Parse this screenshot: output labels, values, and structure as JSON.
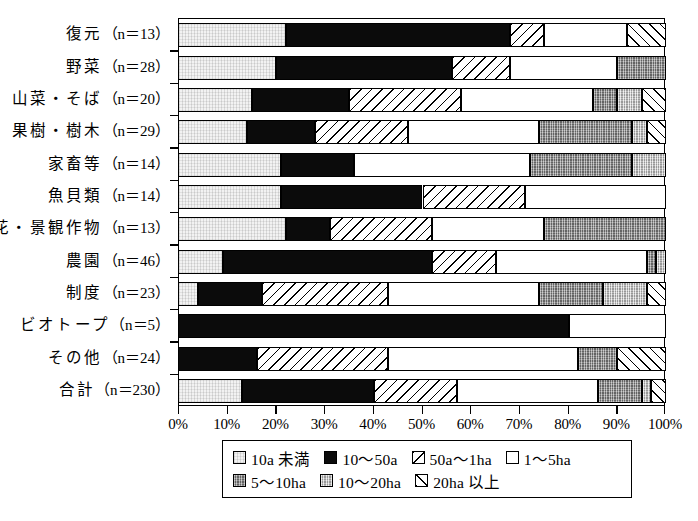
{
  "chart_data": {
    "type": "bar",
    "orientation": "horizontal",
    "stacked": true,
    "normalized": true,
    "title": "",
    "xlabel": "",
    "ylabel": "",
    "xlim": [
      0,
      100
    ],
    "xticks": [
      "0%",
      "10%",
      "20%",
      "30%",
      "40%",
      "50%",
      "60%",
      "70%",
      "80%",
      "90%",
      "100%"
    ],
    "grid": false,
    "legend_position": "bottom",
    "categories": [
      {
        "name": "復元",
        "n": "13",
        "label_name": "復元",
        "label_count": "（n＝13）"
      },
      {
        "name": "野菜",
        "n": "28",
        "label_name": "野菜",
        "label_count": "（n＝28）"
      },
      {
        "name": "山菜・そば",
        "n": "20",
        "label_name": "山菜・そば",
        "label_count": "（n＝20）"
      },
      {
        "name": "果樹・樹木",
        "n": "29",
        "label_name": "果樹・樹木",
        "label_count": "（n＝29）"
      },
      {
        "name": "家畜等",
        "n": "14",
        "label_name": "家畜等",
        "label_count": "（n＝14）"
      },
      {
        "name": "魚貝類",
        "n": "14",
        "label_name": "魚貝類",
        "label_count": "（n＝14）"
      },
      {
        "name": "花・景観作物",
        "n": "13",
        "label_name": "花・景観作物",
        "label_count": "（n＝13）"
      },
      {
        "name": "農園",
        "n": "46",
        "label_name": "農園",
        "label_count": "（n＝46）"
      },
      {
        "name": "制度",
        "n": "23",
        "label_name": "制度",
        "label_count": "（n＝23）"
      },
      {
        "name": "ビオトープ",
        "n": "5",
        "label_name": "ビオトープ",
        "label_count": "（n＝5）"
      },
      {
        "name": "その他",
        "n": "24",
        "label_name": "その他",
        "label_count": "（n＝24）"
      },
      {
        "name": "合計",
        "n": "230",
        "label_name": "合計",
        "label_count": "（n＝230）"
      }
    ],
    "series": [
      {
        "name": "10a未満",
        "key": "lt10a",
        "pattern": "fine-dotted-light-gray",
        "values": [
          22,
          20,
          15,
          14,
          21,
          21,
          22,
          9,
          4,
          0,
          0,
          13
        ]
      },
      {
        "name": "10～50a",
        "key": "a10_50",
        "pattern": "solid-black",
        "values": [
          46,
          36,
          20,
          14,
          15,
          29,
          9,
          43,
          13,
          80,
          16,
          27
        ]
      },
      {
        "name": "50a～1ha",
        "key": "a50_1ha",
        "pattern": "diagonal-hatch-down",
        "values": [
          7,
          12,
          23,
          19,
          0,
          21,
          21,
          13,
          26,
          0,
          27,
          17
        ]
      },
      {
        "name": "1～5ha",
        "key": "ha1_5",
        "pattern": "white",
        "values": [
          17,
          22,
          27,
          27,
          36,
          29,
          23,
          31,
          31,
          20,
          39,
          29
        ]
      },
      {
        "name": "5～10ha",
        "key": "ha5_10",
        "pattern": "dark-gray-stipple",
        "values": [
          0,
          10,
          5,
          19,
          21,
          0,
          25,
          2,
          13,
          0,
          8,
          9
        ]
      },
      {
        "name": "10～20ha",
        "key": "ha10_20",
        "pattern": "light-gray-stipple",
        "values": [
          0,
          0,
          5,
          3,
          7,
          0,
          0,
          2,
          9,
          0,
          0,
          2
        ]
      },
      {
        "name": "20ha以上",
        "key": "gt20ha",
        "pattern": "diagonal-hatch-up",
        "values": [
          8,
          0,
          5,
          4,
          0,
          0,
          0,
          0,
          4,
          0,
          10,
          3
        ]
      }
    ]
  },
  "legend": {
    "items": [
      {
        "label": "10a 未満",
        "key": "lt10a"
      },
      {
        "label": "10～50a",
        "key": "a10_50"
      },
      {
        "label": "50a～1ha",
        "key": "a50_1ha"
      },
      {
        "label": "1～5ha",
        "key": "ha1_5"
      },
      {
        "label": "5～10ha",
        "key": "ha5_10"
      },
      {
        "label": "10～20ha",
        "key": "ha10_20"
      },
      {
        "label": "20ha 以上",
        "key": "gt20ha"
      }
    ]
  }
}
